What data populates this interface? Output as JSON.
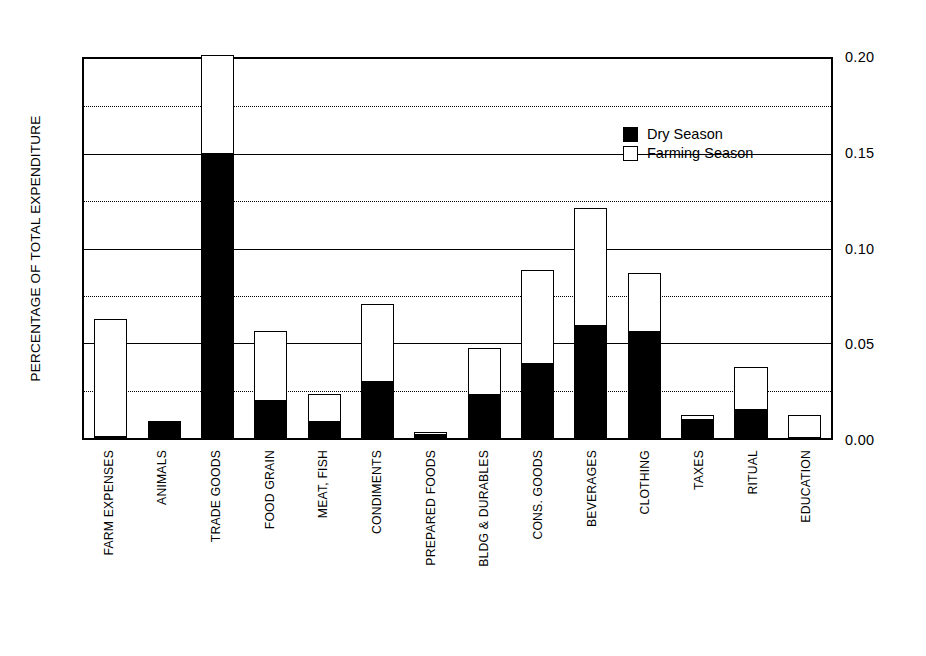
{
  "chart_data": {
    "type": "bar",
    "subtype": "stacked",
    "title": "",
    "xlabel": "",
    "ylabel": "PERCENTAGE OF TOTAL EXPENDITURE",
    "ylim": [
      0.0,
      0.2
    ],
    "yticks": [
      "0.00",
      "0.05",
      "0.10",
      "0.15",
      "0.20"
    ],
    "ytick_values": [
      0.0,
      0.05,
      0.1,
      0.15,
      0.2
    ],
    "gridlines": [
      0.025,
      0.075,
      0.125,
      0.175
    ],
    "grid": true,
    "grid_style": "dotted",
    "legend_position": "upper right inside",
    "categories": [
      "FARM EXPENSES",
      "ANIMALS",
      "TRADE GOODS",
      "FOOD GRAIN",
      "MEAT, FISH",
      "CONDIMENTS",
      "PREPARED FOODS",
      "BLDG & DURABLES",
      "CONS. GOODS",
      "BEVERAGES",
      "CLOTHING",
      "TAXES",
      "RITUAL",
      "EDUCATION"
    ],
    "series": [
      {
        "name": "Dry Season",
        "color": "#000000",
        "values": [
          0.001,
          0.009,
          0.149,
          0.02,
          0.009,
          0.03,
          0.002,
          0.023,
          0.039,
          0.059,
          0.056,
          0.01,
          0.015,
          0.0
        ]
      },
      {
        "name": "Farming Season",
        "color": "#ffffff",
        "values": [
          0.061,
          0.0,
          0.056,
          0.036,
          0.014,
          0.04,
          0.001,
          0.024,
          0.049,
          0.061,
          0.03,
          0.002,
          0.022,
          0.012
        ]
      }
    ],
    "totals": [
      0.062,
      0.009,
      0.205,
      0.056,
      0.023,
      0.07,
      0.003,
      0.047,
      0.088,
      0.12,
      0.086,
      0.012,
      0.037,
      0.012
    ]
  },
  "legend": {
    "items": [
      {
        "label": "Dry Season",
        "swatch": "filled-black-square"
      },
      {
        "label": "Farming Season",
        "swatch": "open-white-square"
      }
    ]
  },
  "colors": {
    "dry_season": "#000000",
    "farming_season": "#ffffff",
    "axis": "#000000",
    "background": "#ffffff"
  }
}
